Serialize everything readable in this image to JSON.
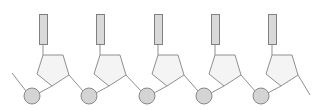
{
  "diagram": {
    "unit_count": 5,
    "unit_spacing": 57.3,
    "colors": {
      "base_fill": "#d9d9d9",
      "base_stroke": "#808080",
      "sugar_fill": "#f4f4f4",
      "sugar_stroke": "#8f8f8f",
      "phosphate_fill": "#d4d4d4",
      "phosphate_stroke": "#8a8a8a",
      "bond": "#8f8f8f",
      "background": "#ffffff"
    },
    "units": [
      {
        "name": "nucleotide-1",
        "phosphate_x": 32
      },
      {
        "name": "nucleotide-2",
        "phosphate_x": 89
      },
      {
        "name": "nucleotide-3",
        "phosphate_x": 147
      },
      {
        "name": "nucleotide-4",
        "phosphate_x": 204
      },
      {
        "name": "nucleotide-5",
        "phosphate_x": 261
      }
    ],
    "labels": []
  }
}
